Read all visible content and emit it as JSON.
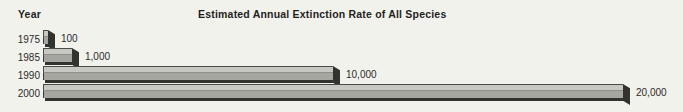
{
  "header": {
    "axis_label": "Year",
    "title": "Estimated Annual Extinction Rate of All Species"
  },
  "chart_data": {
    "type": "bar",
    "orientation": "horizontal",
    "title": "Estimated Annual Extinction Rate of All Species",
    "ylabel": "Year",
    "xlabel": "",
    "categories": [
      "1975",
      "1985",
      "1990",
      "2000"
    ],
    "values": [
      100,
      1000,
      10000,
      20000
    ],
    "value_labels": [
      "100",
      "1,000",
      "10,000",
      "20,000"
    ],
    "xlim": [
      0,
      20000
    ],
    "grid": false,
    "legend": null,
    "style": "3d-extruded-bars",
    "colors": {
      "background": "#f2f2ed",
      "bar_top_face": "#c7c8c2",
      "bar_front_face": "#a5a6a0",
      "bar_shadow": "#32322e",
      "text": "#1f1f1d"
    }
  }
}
